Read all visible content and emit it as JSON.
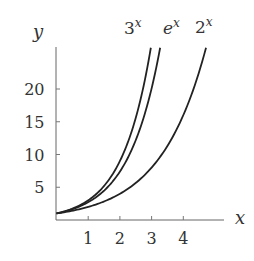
{
  "chart_data": {
    "type": "line",
    "title": "",
    "xlabel": "x",
    "ylabel": "y",
    "xlim": [
      0,
      5.3
    ],
    "ylim": [
      0,
      26.3
    ],
    "xticks": [
      1,
      2,
      3,
      4
    ],
    "yticks": [
      5,
      10,
      15,
      20
    ],
    "grid": false,
    "legend": "inline labels at curve ends",
    "series": [
      {
        "name": "3^x",
        "label_base": "3",
        "label_exp": "x",
        "base": 3,
        "x": [
          0,
          0.5,
          1,
          1.5,
          2,
          2.5,
          2.97
        ],
        "y": [
          1,
          1.73,
          3,
          5.2,
          9,
          15.59,
          26.1
        ]
      },
      {
        "name": "e^x",
        "label_base": "e",
        "label_exp": "x",
        "base": 2.718281828,
        "x": [
          0,
          0.5,
          1,
          1.5,
          2,
          2.5,
          3,
          3.26
        ],
        "y": [
          1,
          1.65,
          2.72,
          4.48,
          7.39,
          12.18,
          20.09,
          26.05
        ]
      },
      {
        "name": "2^x",
        "label_base": "2",
        "label_exp": "x",
        "base": 2,
        "x": [
          0,
          1,
          2,
          3,
          4,
          4.5,
          4.71
        ],
        "y": [
          1,
          2,
          4,
          8,
          16,
          22.63,
          26.17
        ]
      }
    ],
    "color": "#222222",
    "axis_color": "#555555"
  }
}
